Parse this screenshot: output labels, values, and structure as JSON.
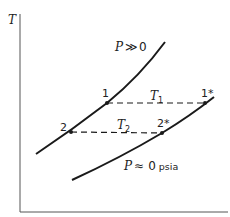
{
  "diagram": {
    "axes": {
      "y_label": "T",
      "x_label": ""
    },
    "curves": [
      {
        "id": "high-pressure",
        "label_var": "P",
        "label_rel": "≫",
        "label_val": "0",
        "points": [
          [
            36,
            154
          ],
          [
            71,
            132
          ],
          [
            107,
            103
          ],
          [
            140,
            73
          ],
          [
            165,
            42
          ]
        ]
      },
      {
        "id": "zero-pressure",
        "label_var": "P",
        "label_rel": "≈",
        "label_val": "0",
        "label_unit": "psia",
        "points": [
          [
            72,
            180
          ],
          [
            120,
            155
          ],
          [
            162,
            133
          ],
          [
            205,
            103
          ],
          [
            214,
            97
          ]
        ]
      }
    ],
    "states": [
      {
        "id": "1",
        "label": "1",
        "x": 107,
        "y": 103
      },
      {
        "id": "2",
        "label": "2",
        "x": 71,
        "y": 132
      },
      {
        "id": "1*",
        "label": "1*",
        "x": 205,
        "y": 103
      },
      {
        "id": "2*",
        "label": "2*",
        "x": 162,
        "y": 133
      }
    ],
    "isotherms": [
      {
        "id": "T1",
        "label": "T",
        "sub": "1",
        "from": "1",
        "to": "1*"
      },
      {
        "id": "T2",
        "label": "T",
        "sub": "2",
        "from": "2",
        "to": "2*"
      }
    ],
    "colors": {
      "line": "#1a1a1a",
      "axis": "#444444",
      "text": "#222222"
    }
  }
}
